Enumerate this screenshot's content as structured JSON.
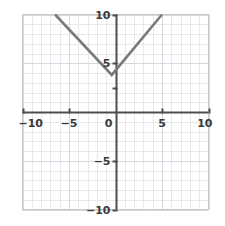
{
  "chart_data": {
    "type": "line",
    "title": "",
    "subtitle": "",
    "xlabel": "",
    "ylabel": "",
    "xlim": [
      -10,
      10
    ],
    "ylim": [
      -10,
      10
    ],
    "grid": true,
    "minor_grid_step": 1,
    "major_grid_step": 5,
    "legend": null,
    "legend_position": "none",
    "axis_color": "#4d4d4d",
    "grid_color_minor": "#e8e8ef",
    "grid_color_major": "#d6d6e0",
    "frame_color": "#c8c8c8",
    "background": "#ffffff",
    "series": [
      {
        "name": "y = |x| + 4",
        "color": "#7a7a7a",
        "width": 2.6,
        "x": [
          -6.5,
          -0.4,
          5.0
        ],
        "y": [
          10.0,
          3.8,
          10.0
        ]
      }
    ],
    "vertex": {
      "x": -0.4,
      "y": 3.8
    },
    "x_ticks": [
      {
        "value": -10,
        "label": "−10"
      },
      {
        "value": -5,
        "label": "−5"
      },
      {
        "value": 0,
        "label": "0"
      },
      {
        "value": 5,
        "label": "5"
      },
      {
        "value": 10,
        "label": "10"
      }
    ],
    "y_ticks": [
      {
        "value": 10,
        "label": "10"
      },
      {
        "value": 5,
        "label": "5"
      },
      {
        "value": 2.5,
        "label": ""
      },
      {
        "value": 0,
        "label": ""
      },
      {
        "value": -5,
        "label": "−5"
      },
      {
        "value": -10,
        "label": "−10"
      }
    ],
    "origin_label": "0"
  }
}
